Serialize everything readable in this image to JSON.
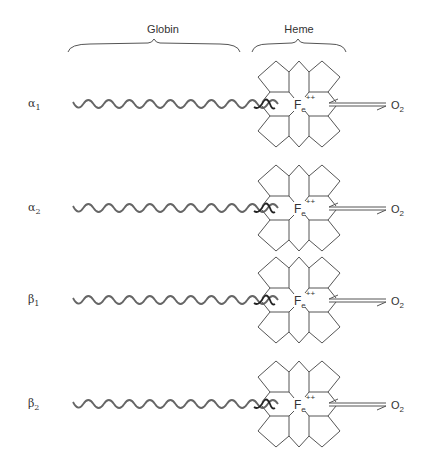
{
  "diagram": {
    "headers": {
      "globin": "Globin",
      "heme": "Heme"
    },
    "rows": [
      {
        "greek": "α",
        "sub": "1",
        "center_y": 104
      },
      {
        "greek": "α",
        "sub": "2",
        "center_y": 208
      },
      {
        "greek": "β",
        "sub": "1",
        "center_y": 300
      },
      {
        "greek": "β",
        "sub": "2",
        "center_y": 404
      }
    ],
    "heme": {
      "iron_symbol": "F",
      "iron_sub": "e",
      "iron_charge": "++"
    },
    "ligand": {
      "symbol": "O",
      "sub": "2"
    },
    "colors": {
      "stroke": "#555555",
      "wave": "#666666",
      "wave_dark": "#222222",
      "text": "#333333"
    }
  }
}
